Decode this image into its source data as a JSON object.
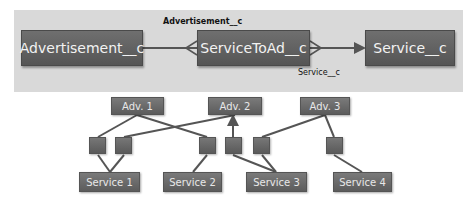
{
  "schema": {
    "objects": [
      {
        "id": "advertisement",
        "label": "Advertisement__c"
      },
      {
        "id": "service_to_ad",
        "label": "ServiceToAd__c"
      },
      {
        "id": "service",
        "label": "Service__c"
      }
    ],
    "relationships": [
      {
        "from": "service_to_ad",
        "to": "advertisement",
        "label": "Advertisement__c"
      },
      {
        "from": "service_to_ad",
        "to": "service",
        "label": "Service__c"
      }
    ]
  },
  "instances": {
    "advertisements": [
      {
        "label": "Adv. 1"
      },
      {
        "label": "Adv. 2"
      },
      {
        "label": "Adv. 3"
      }
    ],
    "services": [
      {
        "label": "Service 1"
      },
      {
        "label": "Service 2"
      },
      {
        "label": "Service 3"
      },
      {
        "label": "Service 4"
      }
    ],
    "junctions": [
      {
        "adv": "Adv. 1",
        "service": "Service 1"
      },
      {
        "adv": "Adv. 2",
        "service": "Service 1"
      },
      {
        "adv": "Adv. 1",
        "service": "Service 2"
      },
      {
        "adv": "Adv. 2",
        "service": "Service 3"
      },
      {
        "adv": "Adv. 3",
        "service": "Service 3"
      },
      {
        "adv": "Adv. 3",
        "service": "Service 4"
      }
    ]
  },
  "colors": {
    "panel": "#d9d9d9",
    "box": "#5f5f5f",
    "line": "#555555"
  }
}
